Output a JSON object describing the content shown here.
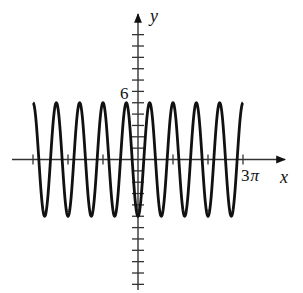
{
  "chart_data": {
    "type": "line",
    "title": "",
    "function": "y = -5 cos(3x)",
    "xlabel": "x",
    "ylabel": "y",
    "xlim": [
      -3.14159,
      9.42478
    ],
    "x_domain_plotted": [
      -9.42478,
      9.42478
    ],
    "ylim": [
      -11,
      13
    ],
    "x_ticks": [
      -9.42478,
      -6.28319,
      -3.14159,
      3.14159,
      6.28319,
      9.42478
    ],
    "x_tick_labels": [
      {
        "value": 9.42478,
        "label": "3π"
      }
    ],
    "y_ticks": [
      -11,
      -10,
      -9,
      -8,
      -7,
      -6,
      -5,
      -4,
      -3,
      -2,
      -1,
      1,
      2,
      3,
      4,
      5,
      6,
      7,
      8,
      9,
      10,
      11
    ],
    "y_tick_labels": [
      {
        "value": 6,
        "label": "6"
      }
    ],
    "amplitude": 5,
    "period": "2π/3",
    "grid": false,
    "legend": null,
    "series": [
      {
        "name": "y = -5cos(3x)",
        "x": [
          -9.42478,
          -8.37758,
          -7.33038,
          -6.28319,
          -5.23599,
          -4.18879,
          -3.14159,
          -2.0944,
          -1.0472,
          0,
          1.0472,
          2.0944,
          3.14159,
          4.18879,
          5.23599,
          6.28319,
          7.33038,
          8.37758,
          9.42478
        ],
        "values": [
          5,
          -5,
          5,
          -5,
          5,
          -5,
          5,
          -5,
          5,
          -5,
          5,
          -5,
          5,
          -5,
          5,
          -5,
          5,
          -5,
          5
        ]
      }
    ]
  },
  "labels": {
    "x_axis": "x",
    "y_axis": "y",
    "x_tick": "3",
    "x_tick_pi": "π",
    "y_tick": "6"
  }
}
